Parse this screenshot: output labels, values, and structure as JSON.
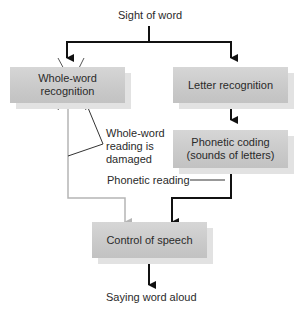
{
  "diagram": {
    "top_label": "Sight of word",
    "boxes": {
      "whole_word": "Whole-word recognition",
      "letter": "Letter recognition",
      "phonetic_coding_line1": "Phonetic coding",
      "phonetic_coding_line2": "(sounds of letters)",
      "control": "Control of speech"
    },
    "annotations": {
      "damaged_line1": "Whole-word",
      "damaged_line2": "reading is",
      "damaged_line3": "damaged",
      "phonetic_reading": "Phonetic reading"
    },
    "bottom_label": "Saying word aloud",
    "colors": {
      "box_fill": "#c9c9c9",
      "box_shadow": "#e2e2e2",
      "arrow_dark": "#111111",
      "arrow_light": "#b5b5b5",
      "text": "#2a2a2a"
    }
  }
}
